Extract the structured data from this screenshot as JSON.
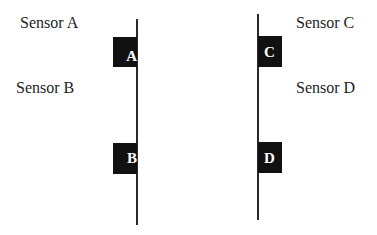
{
  "diagram": {
    "labels": [
      {
        "id": "A",
        "text": "Sensor A"
      },
      {
        "id": "B",
        "text": "Sensor B"
      },
      {
        "id": "C",
        "text": "Sensor C"
      },
      {
        "id": "D",
        "text": "Sensor D"
      }
    ],
    "markers": [
      {
        "id": "A",
        "text": "A",
        "line": "left"
      },
      {
        "id": "B",
        "text": "B",
        "line": "left"
      },
      {
        "id": "C",
        "text": "C",
        "line": "right"
      },
      {
        "id": "D",
        "text": "D",
        "line": "right"
      }
    ],
    "colors": {
      "marker_fill": "#111111",
      "marker_text": "#ffffff",
      "line": "#2a2a2a",
      "text": "#1e1e1e"
    }
  }
}
